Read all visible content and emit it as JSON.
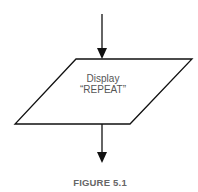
{
  "diagram": {
    "type": "flowchart-fragment",
    "nodes": [
      {
        "id": "display-node",
        "shape": "parallelogram",
        "role": "input-output",
        "lines": [
          "Display",
          "“REPEAT”"
        ]
      }
    ],
    "edges": [
      {
        "from": "above",
        "to": "display-node",
        "direction": "down"
      },
      {
        "from": "display-node",
        "to": "below",
        "direction": "down"
      }
    ],
    "caption": "FIGURE 5.1",
    "colors": {
      "stroke": "#111111",
      "text": "#555555",
      "caption": "#666666",
      "background": "#ffffff"
    }
  }
}
